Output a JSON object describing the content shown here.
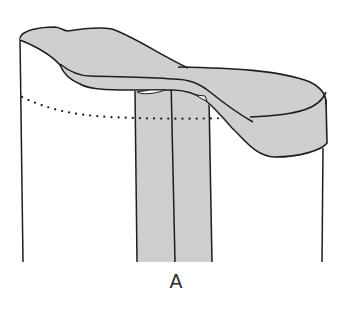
{
  "figure": {
    "label": "A",
    "colors": {
      "fill": "#cfcfcf",
      "stroke": "#1e1e1e",
      "background": "#ffffff"
    },
    "parts": [
      "left-side-edge",
      "right-side-edge",
      "folded-flap",
      "center-band",
      "center-seam",
      "dotted-fold-line"
    ]
  }
}
